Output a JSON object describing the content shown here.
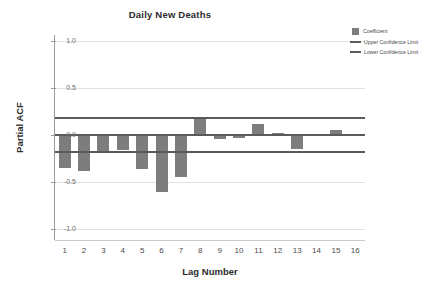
{
  "chart_data": {
    "type": "bar",
    "title": "Daily New Deaths",
    "xlabel": "Lag Number",
    "ylabel": "Partial ACF",
    "categories": [
      1,
      2,
      3,
      4,
      5,
      6,
      7,
      8,
      9,
      10,
      11,
      12,
      13,
      14,
      15,
      16
    ],
    "values": [
      -0.35,
      -0.38,
      -0.19,
      -0.16,
      -0.36,
      -0.61,
      -0.45,
      0.18,
      -0.04,
      -0.03,
      0.12,
      0.02,
      -0.15,
      0.0,
      0.05,
      -0.01
    ],
    "series": [
      {
        "name": "Coefficient",
        "values": [
          -0.35,
          -0.38,
          -0.19,
          -0.16,
          -0.36,
          -0.61,
          -0.45,
          0.18,
          -0.04,
          -0.03,
          0.12,
          0.02,
          -0.15,
          0.0,
          0.05,
          -0.01
        ]
      }
    ],
    "upper_confidence_limit": 0.18,
    "lower_confidence_limit": -0.18,
    "ylim": [
      -1.0,
      1.0
    ],
    "yticks": [
      "1.0",
      "0.5",
      "0.0",
      "-0.5",
      "-1.0"
    ],
    "ytick_values": [
      1.0,
      0.5,
      0.0,
      -0.5,
      -1.0
    ],
    "xtick_labels": [
      "1",
      "2",
      "3",
      "4",
      "5",
      "6",
      "7",
      "8",
      "9",
      "10",
      "11",
      "12",
      "13",
      "14",
      "15",
      "16"
    ],
    "grid": true,
    "legend_position": "top-right",
    "colors": {
      "bar": "#7d7d7d",
      "line": "#5a5a5a",
      "grid": "#e2e2e2",
      "axis": "#9a9a9a",
      "text": "#3a3a3a",
      "background": "#ffffff"
    }
  },
  "legend": {
    "items": [
      {
        "label": "Coefficient",
        "marker": "square-swatch"
      },
      {
        "label": "Upper Confidence Limit",
        "marker": "line-swatch"
      },
      {
        "label": "Lower Confidence Limit",
        "marker": "line-swatch"
      }
    ]
  }
}
